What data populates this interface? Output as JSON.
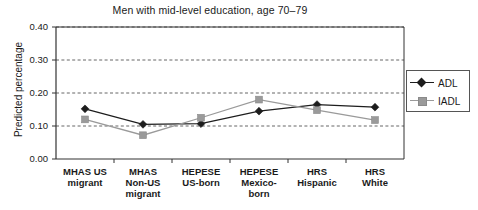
{
  "chart_data": {
    "type": "line",
    "title": "Men with mid-level education, age 70–79",
    "xlabel": "",
    "ylabel": "Predicted percentage",
    "categories": [
      "MHAS US migrant",
      "MHAS Non-US migrant",
      "HEPESE US-born",
      "HEPESE Mexico-born",
      "HRS Hispanic",
      "HRS White"
    ],
    "category_lines": [
      [
        "MHAS US",
        "migrant"
      ],
      [
        "MHAS",
        "Non-US",
        "migrant"
      ],
      [
        "HEPESE",
        "US-born"
      ],
      [
        "HEPESE",
        "Mexico-",
        "born"
      ],
      [
        "HRS",
        "Hispanic"
      ],
      [
        "HRS",
        "White"
      ]
    ],
    "series": [
      {
        "name": "ADL",
        "color": "#1d1d1d",
        "marker": "diamond",
        "values": [
          0.152,
          0.105,
          0.107,
          0.145,
          0.165,
          0.157
        ]
      },
      {
        "name": "IADL",
        "color": "#9a9a9a",
        "marker": "square",
        "values": [
          0.12,
          0.072,
          0.125,
          0.18,
          0.148,
          0.118
        ]
      }
    ],
    "ylim": [
      0.0,
      0.4
    ],
    "ytick_values": [
      0.0,
      0.1,
      0.2,
      0.3,
      0.4
    ],
    "ytick_labels": [
      "0.00",
      "0.10",
      "0.20",
      "0.30",
      "0.40"
    ],
    "grid": true,
    "grid_style": "dashed-horizontal",
    "legend_position": "right",
    "legend_entries": [
      "ADL",
      "IADL"
    ]
  }
}
